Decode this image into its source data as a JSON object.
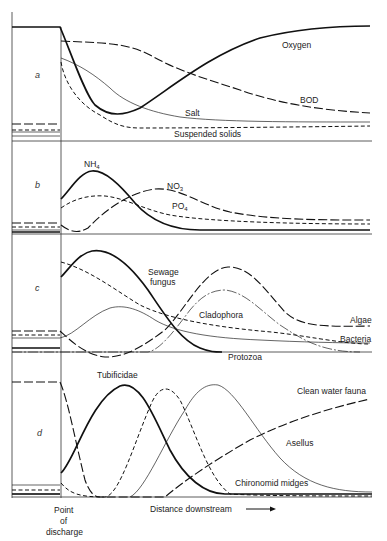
{
  "panels": [
    {
      "id": "a",
      "label": "a",
      "curves": [
        {
          "name": "Oxygen",
          "style": "thick"
        },
        {
          "name": "BOD",
          "style": "long-dash"
        },
        {
          "name": "Salt",
          "style": "thin"
        },
        {
          "name": "Suspended solids",
          "style": "short-dash"
        }
      ]
    },
    {
      "id": "b",
      "label": "b",
      "curves": [
        {
          "name": "NH4",
          "style": "thick"
        },
        {
          "name": "NO3",
          "style": "long-dash"
        },
        {
          "name": "PO4",
          "style": "short-dash"
        }
      ]
    },
    {
      "id": "c",
      "label": "c",
      "curves": [
        {
          "name": "Sewage fungus",
          "style": "thick"
        },
        {
          "name": "Cladophora",
          "style": "dash-dot"
        },
        {
          "name": "Algae",
          "style": "long-dash"
        },
        {
          "name": "Bacteria",
          "style": "short-dash"
        },
        {
          "name": "Protozoa",
          "style": "thin"
        }
      ]
    },
    {
      "id": "d",
      "label": "d",
      "curves": [
        {
          "name": "Tubificidae",
          "style": "thick"
        },
        {
          "name": "Chironomid midges",
          "style": "short-dash"
        },
        {
          "name": "Asellus",
          "style": "thin"
        },
        {
          "name": "Clean water fauna",
          "style": "long-dash"
        }
      ]
    }
  ],
  "labels": {
    "oxygen": "Oxygen",
    "bod": "BOD",
    "salt": "Salt",
    "suspended_solids": "Suspended solids",
    "nh4": "NH",
    "nh4_sub": "4",
    "no3": "NO",
    "no3_sub": "3",
    "po4": "PO",
    "po4_sub": "4",
    "sewage": "Sewage",
    "fungus": "fungus",
    "cladophora": "Cladophora",
    "algae": "Algae",
    "bacteria": "Bacteria",
    "protozoa": "Protozoa",
    "tubificidae": "Tubificidae",
    "clean_water_fauna": "Clean water fauna",
    "asellus": "Asellus",
    "chironomid": "Chironomid midges",
    "panel_a": "a",
    "panel_b": "b",
    "panel_c": "c",
    "panel_d": "d"
  },
  "x_axis": {
    "point_line1": "Point",
    "point_line2": "of",
    "point_line3": "discharge",
    "distance_label": "Distance downstream",
    "arrow": "→"
  }
}
